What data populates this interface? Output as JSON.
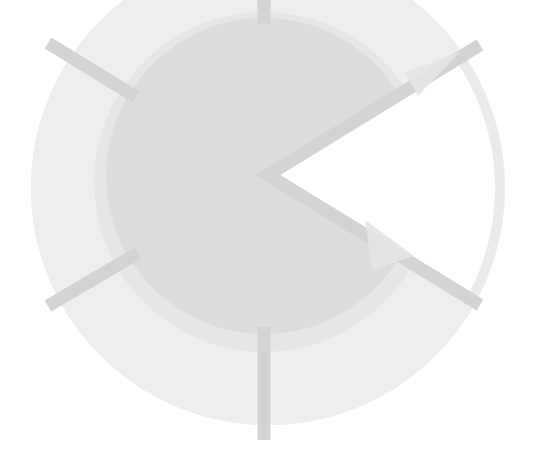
{
  "diagram": {
    "center": [
      262,
      175
    ],
    "colors": {
      "background": "#ffffff",
      "outer_disc": "#eeeeee",
      "mid_disc": "#e6e6e6",
      "inner_disc": "#dcdcdc",
      "outer_ring_arc": "#ebebeb",
      "spoke": "#d3d3d3",
      "arrowhead": "#e4e4e4"
    },
    "discs": [
      {
        "name": "outer",
        "cx": 268,
        "cy": 188,
        "r": 237
      },
      {
        "name": "mid",
        "cx": 264,
        "cy": 182,
        "r": 170
      },
      {
        "name": "inner",
        "cx": 264,
        "cy": 176,
        "r": 158
      }
    ],
    "wedge_angle_deg": [
      -30,
      30
    ],
    "spokes": [
      {
        "name": "top",
        "x1": 264,
        "y1": -10,
        "x2": 264,
        "y2": 24
      },
      {
        "name": "upper-left",
        "x1": 48,
        "y1": 43,
        "x2": 136,
        "y2": 97
      },
      {
        "name": "lower-left",
        "x1": 48,
        "y1": 306,
        "x2": 138,
        "y2": 253
      },
      {
        "name": "bottom",
        "x1": 264,
        "y1": 327,
        "x2": 264,
        "y2": 440
      },
      {
        "name": "upper-right",
        "x1": 268,
        "y1": 175,
        "x2": 483,
        "y2": 43
      },
      {
        "name": "lower-right",
        "x1": 268,
        "y1": 175,
        "x2": 483,
        "y2": 306
      }
    ],
    "arrows": [
      {
        "name": "upper-right-arrow",
        "points": "405,75 455,57 420,95"
      },
      {
        "name": "lower-right-arrow",
        "points": "367,222 375,268 412,255"
      }
    ]
  }
}
